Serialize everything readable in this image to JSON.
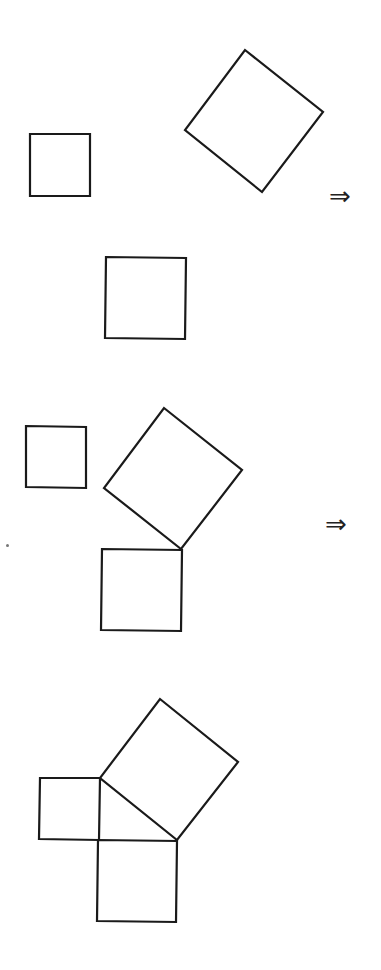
{
  "diagram": {
    "stroke_color": "#1a1a1a",
    "background": "#ffffff",
    "stages": [
      {
        "name": "separated",
        "small_square": "30,134 90,134 90,196 30,196",
        "tilted_square": "245,50 323,112 262,192 185,130",
        "medium_square": "106,257 186,258 185,339 105,338",
        "arrow": {
          "symbol": "⇒",
          "x": 329,
          "y": 183
        }
      },
      {
        "name": "partially-joined",
        "small_square": "26,426 86,427 86,488 26,487",
        "tilted_square": "164,408 242,470 181,549 104,488",
        "medium_square": "102,549 182,550 181,631 101,630",
        "arrow": {
          "symbol": "⇒",
          "x": 325,
          "y": 511
        }
      },
      {
        "name": "joined-right-triangle",
        "small_square": "40,778 100,778 99,840 39,839",
        "tilted_square": "160,699 238,762 177,840 100,778",
        "medium_square": "98,840 177,841 176,922 97,921"
      }
    ]
  }
}
